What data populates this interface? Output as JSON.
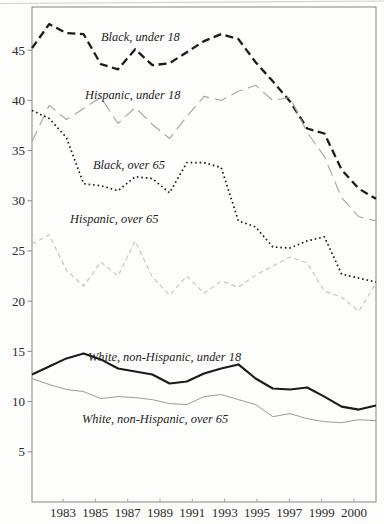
{
  "figure": {
    "kind": "scanned-book-line-chart",
    "background_color": "#fdfdfc",
    "border_color": "#909090",
    "text_color": "#2b2b2b"
  },
  "chart_data": {
    "type": "line",
    "title": "",
    "xlabel": "",
    "ylabel": "",
    "grid": false,
    "legend_position": "inline-labels-on-chart",
    "xlim": [
      1981,
      2001
    ],
    "ylim": [
      0,
      49.3
    ],
    "x": [
      1981,
      1982,
      1983,
      1984,
      1985,
      1986,
      1987,
      1988,
      1989,
      1990,
      1991,
      1992,
      1993,
      1994,
      1995,
      1996,
      1997,
      1998,
      1999,
      2000,
      2001
    ],
    "x_ticks": [
      {
        "label": "1983",
        "year": 1983
      },
      {
        "label": "1985",
        "year": 1985
      },
      {
        "label": "1987",
        "year": 1987
      },
      {
        "label": "1989",
        "year": 1989
      },
      {
        "label": "1991",
        "year": 1991
      },
      {
        "label": "1993",
        "year": 1993
      },
      {
        "label": "1995",
        "year": 1995
      },
      {
        "label": "1997",
        "year": 1997
      },
      {
        "label": "1999",
        "year": 1999
      },
      {
        "label": "2000",
        "year": 2000
      }
    ],
    "y_ticks": [
      5,
      10,
      15,
      20,
      25,
      30,
      35,
      40,
      45
    ],
    "series": [
      {
        "name": "Black, under 18",
        "style": "bold-dash",
        "color": "#1b1b1b",
        "values": [
          45.2,
          47.6,
          46.7,
          46.6,
          43.6,
          43.1,
          45.1,
          43.5,
          43.7,
          44.8,
          45.9,
          46.6,
          46.1,
          43.8,
          41.9,
          39.9,
          37.2,
          36.7,
          33.1,
          31.2,
          30.2
        ]
      },
      {
        "name": "Hispanic, under 18",
        "style": "long-dash",
        "color": "#a8a8a8",
        "values": [
          35.9,
          39.5,
          38.1,
          39.2,
          40.3,
          37.7,
          39.3,
          37.6,
          36.2,
          38.4,
          40.4,
          40.0,
          40.9,
          41.5,
          40.0,
          40.3,
          36.8,
          34.4,
          30.3,
          28.4,
          28.0
        ]
      },
      {
        "name": "Black, over 65",
        "style": "dotted",
        "color": "#1b1b1b",
        "values": [
          39.0,
          38.2,
          36.3,
          31.7,
          31.5,
          31.0,
          32.4,
          32.2,
          30.8,
          33.8,
          33.8,
          33.3,
          28.0,
          27.4,
          25.4,
          25.3,
          26.0,
          26.4,
          22.7,
          22.3,
          21.9
        ]
      },
      {
        "name": "Hispanic, over 65",
        "style": "short-dash",
        "color": "#c2c2c2",
        "values": [
          25.7,
          26.6,
          23.1,
          21.5,
          23.9,
          22.5,
          26.0,
          22.4,
          20.6,
          22.5,
          20.8,
          22.0,
          21.4,
          22.6,
          23.5,
          24.4,
          23.8,
          21.0,
          20.4,
          19.0,
          21.8
        ]
      },
      {
        "name": "White, non-Hispanic, under 18",
        "style": "bold-solid",
        "color": "#1b1b1b",
        "values": [
          12.7,
          13.5,
          14.3,
          14.8,
          14.2,
          13.3,
          13.0,
          12.7,
          11.8,
          12.0,
          12.8,
          13.3,
          13.7,
          12.3,
          11.3,
          11.2,
          11.4,
          10.5,
          9.5,
          9.2,
          9.6
        ]
      },
      {
        "name": "White, non-Hispanic, over 65",
        "style": "thin-solid",
        "color": "#9b9b9b",
        "values": [
          12.3,
          11.7,
          11.2,
          11.0,
          10.3,
          10.5,
          10.4,
          10.2,
          9.8,
          9.7,
          10.5,
          10.7,
          10.2,
          9.7,
          8.5,
          8.8,
          8.3,
          8.0,
          7.9,
          8.2,
          8.1
        ]
      }
    ]
  }
}
